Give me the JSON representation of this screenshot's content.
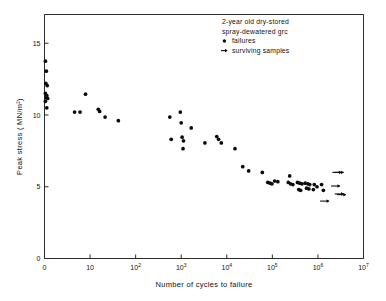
{
  "chart_data": {
    "type": "scatter",
    "title": "",
    "xlabel": "Number of cycles to failure",
    "ylabel": "Peak stress  ( MN/m²)",
    "xscale": "log",
    "xlim": [
      0,
      7
    ],
    "ylim": [
      0,
      17
    ],
    "grid": false,
    "legend_position": "top-right",
    "xticks": [
      {
        "label": "0",
        "sup": "",
        "pos": 0
      },
      {
        "label": "10",
        "sup": "",
        "pos": 1
      },
      {
        "label": "10",
        "sup": "2",
        "pos": 2
      },
      {
        "label": "10",
        "sup": "3",
        "pos": 3
      },
      {
        "label": "10",
        "sup": "4",
        "pos": 4
      },
      {
        "label": "10",
        "sup": "5",
        "pos": 5
      },
      {
        "label": "10",
        "sup": "6",
        "pos": 6
      },
      {
        "label": "10",
        "sup": "7",
        "pos": 7
      }
    ],
    "yticks": [
      {
        "label": "0",
        "value": 0
      },
      {
        "label": "5",
        "value": 5
      },
      {
        "label": "10",
        "value": 10
      },
      {
        "label": "15",
        "value": 15
      }
    ],
    "annotations": [
      "2-year old dry-stored",
      "spray-dewatered grc"
    ],
    "legend": [
      {
        "marker": "dot",
        "label": "failures"
      },
      {
        "marker": "arrow",
        "label": "surviving samples"
      }
    ],
    "series": [
      {
        "name": "failures",
        "marker": "dot",
        "points": [
          [
            0.02,
            13.75
          ],
          [
            0.04,
            13.05
          ],
          [
            0.03,
            12.2
          ],
          [
            0.06,
            12.05
          ],
          [
            0.02,
            11.5
          ],
          [
            0.05,
            11.35
          ],
          [
            0.03,
            11.2
          ],
          [
            0.07,
            11.15
          ],
          [
            0.02,
            10.95
          ],
          [
            0.05,
            10.5
          ],
          [
            0.66,
            10.2
          ],
          [
            0.78,
            10.2
          ],
          [
            0.9,
            11.45
          ],
          [
            1.18,
            10.4
          ],
          [
            1.21,
            10.25
          ],
          [
            1.33,
            9.85
          ],
          [
            1.62,
            9.6
          ],
          [
            2.75,
            9.85
          ],
          [
            2.78,
            8.3
          ],
          [
            2.98,
            10.2
          ],
          [
            3.0,
            9.45
          ],
          [
            3.02,
            8.45
          ],
          [
            3.05,
            8.2
          ],
          [
            3.04,
            7.65
          ],
          [
            3.22,
            9.1
          ],
          [
            3.52,
            8.05
          ],
          [
            3.78,
            8.5
          ],
          [
            3.82,
            8.3
          ],
          [
            3.88,
            8.05
          ],
          [
            4.18,
            7.65
          ],
          [
            4.35,
            6.4
          ],
          [
            4.48,
            6.1
          ],
          [
            4.78,
            6.0
          ],
          [
            4.9,
            5.3
          ],
          [
            4.95,
            5.25
          ],
          [
            4.99,
            5.2
          ],
          [
            5.05,
            5.4
          ],
          [
            5.12,
            5.35
          ],
          [
            5.35,
            5.3
          ],
          [
            5.4,
            5.2
          ],
          [
            5.45,
            5.15
          ],
          [
            5.38,
            5.75
          ],
          [
            5.55,
            5.3
          ],
          [
            5.6,
            5.25
          ],
          [
            5.65,
            5.2
          ],
          [
            5.58,
            4.8
          ],
          [
            5.62,
            4.75
          ],
          [
            5.72,
            5.25
          ],
          [
            5.78,
            5.2
          ],
          [
            5.82,
            5.15
          ],
          [
            5.75,
            4.9
          ],
          [
            5.8,
            4.85
          ],
          [
            5.92,
            5.15
          ],
          [
            5.98,
            5.0
          ],
          [
            5.9,
            4.8
          ],
          [
            6.08,
            5.15
          ],
          [
            6.12,
            4.75
          ]
        ]
      },
      {
        "name": "surviving samples",
        "marker": "arrow",
        "points": [
          [
            6.45,
            6.0
          ],
          [
            6.5,
            6.0
          ],
          [
            6.42,
            5.05
          ],
          [
            6.5,
            4.5
          ],
          [
            6.55,
            4.45
          ],
          [
            6.18,
            4.0
          ]
        ]
      }
    ]
  }
}
